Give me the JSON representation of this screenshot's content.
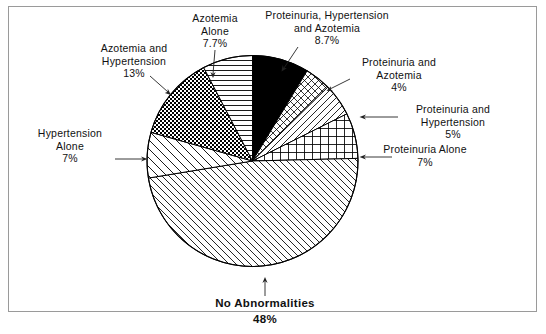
{
  "chart_data": {
    "type": "pie",
    "title": "",
    "subtitle": "",
    "xlabel": "",
    "ylabel": "",
    "legend_position": "callout-labels",
    "grid": false,
    "start_angle_deg": -90,
    "direction": "clockwise",
    "categories": [
      "Proteinuria, Hypertension and Azotemia",
      "Proteinuria and Azotemia",
      "Proteinuria and Hypertension",
      "Proteinuria Alone",
      "No Abnormalities",
      "Hypertension Alone",
      "Azotemia and Hypertension",
      "Azotemia Alone"
    ],
    "values": [
      8.7,
      4,
      5,
      7,
      48,
      7,
      13,
      7.7
    ],
    "value_unit": "%",
    "slices": [
      {
        "label_line1": "Proteinuria, Hypertension",
        "label_line2": "and Azotemia",
        "percent": "8.7%",
        "value": 8.7,
        "fill_pattern": "solid-black",
        "fill_color": "#000000"
      },
      {
        "label_line1": "Proteinuria and",
        "label_line2": "Azotemia",
        "percent": "4%",
        "value": 4,
        "fill_pattern": "diagonal-crosshatch",
        "fill_color": "#ffffff"
      },
      {
        "label_line1": "Proteinuria and",
        "label_line2": "Hypertension",
        "percent": "5%",
        "value": 5,
        "fill_pattern": "diagonal-lines-right",
        "fill_color": "#ffffff"
      },
      {
        "label_line1": "Proteinuria Alone",
        "label_line2": "",
        "percent": "7%",
        "value": 7,
        "fill_pattern": "square-grid",
        "fill_color": "#ffffff"
      },
      {
        "label_line1": "No Abnormalities",
        "label_line2": "",
        "percent": "48%",
        "value": 48,
        "fill_pattern": "diagonal-lines-left",
        "fill_color": "#ffffff"
      },
      {
        "label_line1": "Hypertension",
        "label_line2": "Alone",
        "percent": "7%",
        "value": 7,
        "fill_pattern": "diagonal-lines-left-wide",
        "fill_color": "#ffffff"
      },
      {
        "label_line1": "Azotemia and",
        "label_line2": "Hypertension",
        "percent": "13%",
        "value": 13,
        "fill_pattern": "dense-checker",
        "fill_color": "#ffffff"
      },
      {
        "label_line1": "Azotemia",
        "label_line2": "Alone",
        "percent": "7.7%",
        "value": 7.7,
        "fill_pattern": "horizontal-lines",
        "fill_color": "#ffffff"
      }
    ],
    "stroke_color": "#000000",
    "background_color": "#ffffff",
    "frame_color": "#9a9a9a"
  }
}
